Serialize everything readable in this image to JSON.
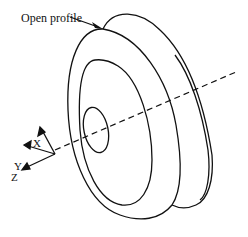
{
  "figure": {
    "type": "technical-illustration",
    "callout": {
      "label": "Open profile"
    },
    "axes": {
      "x_label": "X",
      "y_label": "Y",
      "z_label": "Z"
    },
    "colors": {
      "stroke": "#111111",
      "background": "#ffffff"
    }
  }
}
